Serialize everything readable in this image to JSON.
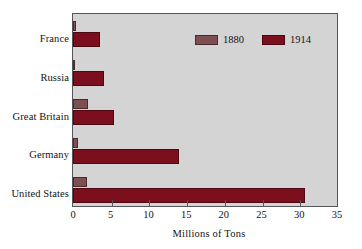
{
  "chart_data": {
    "type": "bar",
    "orientation": "horizontal",
    "title": "",
    "xlabel": "Millions of Tons",
    "ylabel": "",
    "xlim": [
      0,
      35
    ],
    "xticks": [
      0,
      5,
      10,
      15,
      20,
      25,
      30,
      35
    ],
    "grid": false,
    "categories": [
      "France",
      "Russia",
      "Great Britain",
      "Germany",
      "United States"
    ],
    "series": [
      {
        "name": "1880",
        "color": "#7d4f52",
        "values": [
          0.4,
          0.3,
          2.0,
          0.7,
          1.9
        ]
      },
      {
        "name": "1914",
        "color": "#7c0f1d",
        "values": [
          3.6,
          4.1,
          5.5,
          14.0,
          30.8
        ]
      }
    ],
    "legend": {
      "position": "top-right-inside",
      "entries": [
        {
          "label": "1880",
          "color": "#7d4f52"
        },
        {
          "label": "1914",
          "color": "#7c0f1d"
        }
      ]
    },
    "style": {
      "plot_background": "#d4d4d4",
      "page_background": "#ffffff",
      "axis_color": "#55555a",
      "text_color": "#131313"
    }
  }
}
